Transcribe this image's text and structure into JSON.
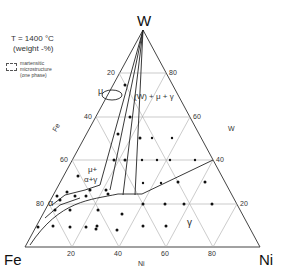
{
  "diagram": {
    "title": "T = 1400 °C",
    "units": "(weight -%)",
    "legend": {
      "line1": "martensitic",
      "line2": "microstructure",
      "line3": "(one phase)"
    },
    "vertices": {
      "top": "W",
      "left": "Fe",
      "right": "Ni"
    },
    "axes": {
      "fe_label": "Fe",
      "w_label": "W",
      "ni_label": "Ni",
      "left_ticks": [
        "20",
        "40",
        "60",
        "80"
      ],
      "right_ticks": [
        "80",
        "60",
        "40",
        "20"
      ],
      "bottom_ticks": [
        "20",
        "40",
        "60",
        "80"
      ]
    },
    "regions": {
      "mu": "μ",
      "w_mu_gamma": "(W) + μ + γ",
      "mu_alpha_gamma_1": "μ+",
      "mu_alpha_gamma_2": "α+γ",
      "alpha": "α",
      "gamma": "γ"
    }
  }
}
